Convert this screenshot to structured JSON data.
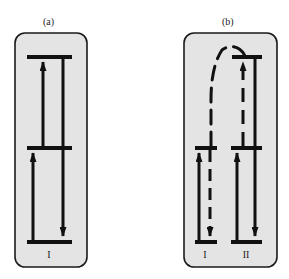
{
  "header": {
    "cut_text": "··· ··· ··· ··· ··· ··· ··· ··· ··· ···"
  },
  "panels": [
    {
      "id": "a",
      "label": "(a)",
      "systems": [
        {
          "label": "I"
        }
      ],
      "description": "Single system I with three energy levels: up-transitions bottom→middle and middle→top, down-transition top→bottom"
    },
    {
      "id": "b",
      "label": "(b)",
      "systems": [
        {
          "label": "I"
        },
        {
          "label": "II"
        }
      ],
      "description": "Two systems I and II: each with up-transition bottom→middle; II has up middle→top (dashed) and down top→bottom; dashed curved energy transfer from I down-path to II top level"
    }
  ],
  "colors": {
    "panel_fill": "#e4e4e4",
    "panel_border": "#1a1a1a",
    "line": "#111111"
  }
}
